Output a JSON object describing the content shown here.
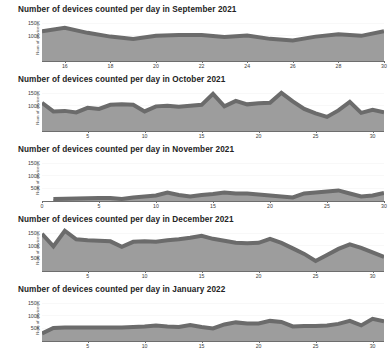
{
  "chart_data": [
    {
      "type": "area",
      "title": "Number of devices counted per day in September 2021",
      "xlabel": "",
      "ylabel": "Num of devices",
      "ylim": [
        0,
        175000
      ],
      "xlim": [
        15,
        30
      ],
      "yticks": [
        100000,
        150000
      ],
      "ytick_labels": [
        "100K",
        "150K"
      ],
      "xticks": [
        16,
        18,
        20,
        22,
        24,
        26,
        28,
        30
      ],
      "xtick_labels": [
        "16",
        "18",
        "20",
        "22",
        "24",
        "26",
        "28",
        "30"
      ],
      "grid": true,
      "x": [
        15,
        16,
        17,
        18,
        19,
        20,
        21,
        22,
        23,
        24,
        25,
        26,
        27,
        28,
        29,
        30
      ],
      "values": [
        118000,
        132000,
        112000,
        97000,
        88000,
        100000,
        103000,
        103000,
        95000,
        101000,
        88000,
        82000,
        97000,
        106000,
        100000,
        118000
      ],
      "series_name": "devices"
    },
    {
      "type": "area",
      "title": "Number of devices counted per day in October 2021",
      "xlabel": "",
      "ylabel": "Num of devices",
      "ylim": [
        0,
        175000
      ],
      "xlim": [
        1,
        31
      ],
      "yticks": [
        100000,
        150000
      ],
      "ytick_labels": [
        "100K",
        "150K"
      ],
      "xticks": [
        5,
        10,
        15,
        20,
        25,
        30
      ],
      "xtick_labels": [
        "5",
        "10",
        "15",
        "20",
        "25",
        "30"
      ],
      "grid": true,
      "x": [
        1,
        2,
        3,
        4,
        5,
        6,
        7,
        8,
        9,
        10,
        11,
        12,
        13,
        14,
        15,
        16,
        17,
        18,
        19,
        20,
        21,
        22,
        23,
        24,
        25,
        26,
        27,
        28,
        29,
        30,
        31
      ],
      "values": [
        112000,
        78000,
        80000,
        74000,
        92000,
        88000,
        104000,
        106000,
        104000,
        78000,
        98000,
        100000,
        96000,
        100000,
        104000,
        148000,
        98000,
        120000,
        106000,
        110000,
        112000,
        152000,
        118000,
        88000,
        70000,
        56000,
        82000,
        116000,
        72000,
        84000,
        74000
      ],
      "series_name": "devices"
    },
    {
      "type": "area",
      "title": "Number of devices counted per day in November 2021",
      "xlabel": "",
      "ylabel": "Num of devices",
      "ylim": [
        0,
        175000
      ],
      "xlim": [
        0,
        30
      ],
      "yticks": [
        50000,
        100000,
        150000
      ],
      "ytick_labels": [
        "50K",
        "100K",
        "150K"
      ],
      "xticks": [
        0,
        5,
        10,
        15,
        20,
        25,
        30
      ],
      "xtick_labels": [
        "0",
        "5",
        "10",
        "15",
        "20",
        "25",
        "30"
      ],
      "grid": true,
      "x": [
        1,
        2,
        3,
        4,
        5,
        6,
        7,
        8,
        9,
        10,
        11,
        12,
        13,
        14,
        15,
        16,
        17,
        18,
        19,
        20,
        21,
        22,
        23,
        24,
        25,
        26,
        27,
        28,
        29,
        30
      ],
      "values": [
        8000,
        9000,
        10000,
        11000,
        12000,
        12000,
        8000,
        14000,
        18000,
        22000,
        34000,
        24000,
        18000,
        24000,
        28000,
        34000,
        30000,
        30000,
        26000,
        22000,
        18000,
        14000,
        30000,
        34000,
        38000,
        42000,
        30000,
        18000,
        22000,
        32000
      ],
      "series_name": "devices"
    },
    {
      "type": "area",
      "title": "Number of devices counted per day in December 2021",
      "xlabel": "",
      "ylabel": "Num of devices",
      "ylim": [
        0,
        175000
      ],
      "xlim": [
        1,
        31
      ],
      "yticks": [
        50000,
        100000,
        150000
      ],
      "ytick_labels": [
        "50K",
        "100K",
        "150K"
      ],
      "xticks": [
        5,
        10,
        15,
        20,
        25,
        30
      ],
      "xtick_labels": [
        "5",
        "10",
        "15",
        "20",
        "25",
        "30"
      ],
      "grid": true,
      "x": [
        1,
        2,
        3,
        4,
        5,
        6,
        7,
        8,
        9,
        10,
        11,
        12,
        13,
        14,
        15,
        16,
        17,
        18,
        19,
        20,
        21,
        22,
        23,
        24,
        25,
        26,
        27,
        28,
        29,
        30,
        31
      ],
      "values": [
        148000,
        98000,
        160000,
        126000,
        122000,
        120000,
        118000,
        96000,
        116000,
        118000,
        116000,
        122000,
        126000,
        132000,
        140000,
        128000,
        120000,
        112000,
        110000,
        112000,
        128000,
        112000,
        90000,
        68000,
        40000,
        64000,
        88000,
        106000,
        92000,
        74000,
        56000
      ],
      "series_name": "devices"
    },
    {
      "type": "area",
      "title": "Number of devices counted per day in January 2022",
      "xlabel": "",
      "ylabel": "Num of devices",
      "ylim": [
        0,
        175000
      ],
      "xlim": [
        1,
        31
      ],
      "yticks": [
        50000,
        100000,
        150000
      ],
      "ytick_labels": [
        "50K",
        "100K",
        "150K"
      ],
      "xticks": [
        5,
        10,
        15,
        20,
        25,
        30
      ],
      "xtick_labels": [
        "5",
        "10",
        "15",
        "20",
        "25",
        "30"
      ],
      "grid": true,
      "x": [
        1,
        2,
        3,
        4,
        5,
        6,
        7,
        8,
        9,
        10,
        11,
        12,
        13,
        14,
        15,
        16,
        17,
        18,
        19,
        20,
        21,
        22,
        23,
        24,
        25,
        26,
        27,
        28,
        29,
        30,
        31
      ],
      "values": [
        30000,
        52000,
        54000,
        54000,
        54000,
        54000,
        54000,
        54000,
        56000,
        58000,
        62000,
        58000,
        56000,
        64000,
        56000,
        50000,
        66000,
        74000,
        70000,
        70000,
        80000,
        76000,
        58000,
        60000,
        60000,
        62000,
        68000,
        80000,
        62000,
        88000,
        78000
      ],
      "series_name": "devices"
    }
  ],
  "style": {
    "area_fill": "#9d9d9d",
    "line_color": "#6b6b6b",
    "grid_color": "#e2e2e2",
    "axis_color": "#6e6e6e",
    "title_color": "#232323",
    "tick_color": "#3c3c3c"
  }
}
